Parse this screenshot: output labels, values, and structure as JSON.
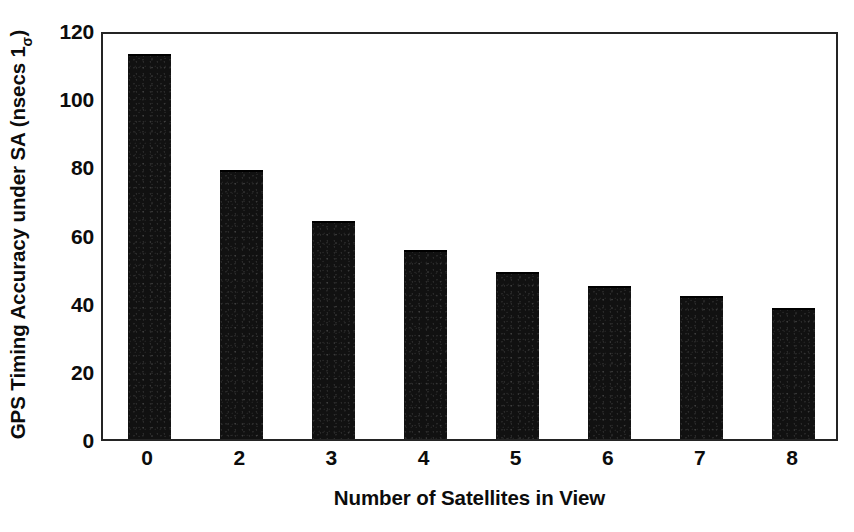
{
  "chart_data": {
    "type": "bar",
    "title": "",
    "subtitle": "",
    "xlabel": "Number of Satellites in View",
    "ylabel": "GPS Timing Accuracy under SA (nsecs 1σ)",
    "ylabel_main": "GPS Timing Accuracy under SA (nsecs 1",
    "ylabel_sub": "σ",
    "ylabel_tail": ")",
    "categories": [
      "0",
      "2",
      "3",
      "4",
      "5",
      "6",
      "7",
      "8"
    ],
    "values": [
      113,
      79,
      64,
      55.5,
      49,
      45,
      42,
      38.5
    ],
    "series": [
      {
        "name": "GPS Timing Accuracy under SA",
        "values": [
          113,
          79,
          64,
          55.5,
          49,
          45,
          42,
          38.5
        ]
      }
    ],
    "ylim": [
      0,
      120
    ],
    "yticks": [
      0,
      20,
      40,
      60,
      80,
      100,
      120
    ],
    "ytick_labels": [
      "0",
      "20",
      "40",
      "60",
      "80",
      "100",
      "120"
    ],
    "xtick_labels": [
      "0",
      "2",
      "3",
      "4",
      "5",
      "6",
      "7",
      "8"
    ],
    "grid": false,
    "legend": false,
    "legend_position": "none",
    "bar_color": "#111111",
    "axis_color": "#242424",
    "background_color": "#ffffff",
    "annotations": []
  }
}
